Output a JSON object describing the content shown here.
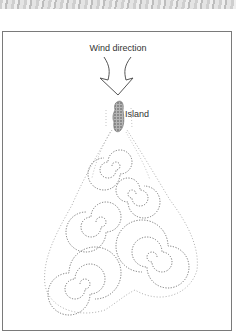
{
  "diagram": {
    "title_label": "Wind direction",
    "island_label": "Island",
    "colors": {
      "ink": "#555555",
      "island_fill": "#8a8a8a",
      "frame": "#7a7a7a"
    }
  }
}
